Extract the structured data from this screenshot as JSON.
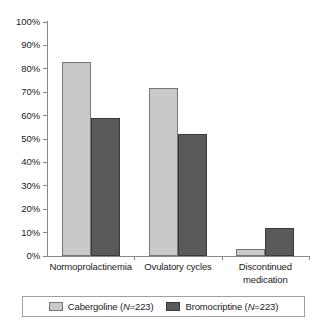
{
  "chart_data": {
    "type": "bar",
    "title": "",
    "subtitle": "",
    "xlabel": "",
    "ylabel": "",
    "ylim": [
      0,
      100
    ],
    "yticks": [
      "0%",
      "10%",
      "20%",
      "30%",
      "40%",
      "50%",
      "60%",
      "70%",
      "80%",
      "90%",
      "100%"
    ],
    "ytick_values": [
      0,
      10,
      20,
      30,
      40,
      50,
      60,
      70,
      80,
      90,
      100
    ],
    "grid": false,
    "legend_position": "bottom",
    "value_suffix": "%",
    "categories": [
      "Normoprolactinemia",
      "Ovulatory cycles",
      "Discontinued medication"
    ],
    "category_lines": [
      [
        "Normoprolactinemia"
      ],
      [
        "Ovulatory cycles"
      ],
      [
        "Discontinued",
        "medication"
      ]
    ],
    "series": [
      {
        "name": "Cabergoline",
        "n_label": "N=223",
        "color": "#c9c9c9",
        "values": [
          83,
          72,
          3
        ]
      },
      {
        "name": "Bromocriptine",
        "n_label": "N=223",
        "color": "#5a5a5a",
        "values": [
          59,
          52,
          12
        ]
      }
    ]
  },
  "legend": {
    "entries": [
      {
        "label_prefix": "Cabergoline (",
        "italic": "N",
        "label_suffix": "=223)"
      },
      {
        "label_prefix": "Bromocriptine (",
        "italic": "N",
        "label_suffix": "=223)"
      }
    ]
  }
}
